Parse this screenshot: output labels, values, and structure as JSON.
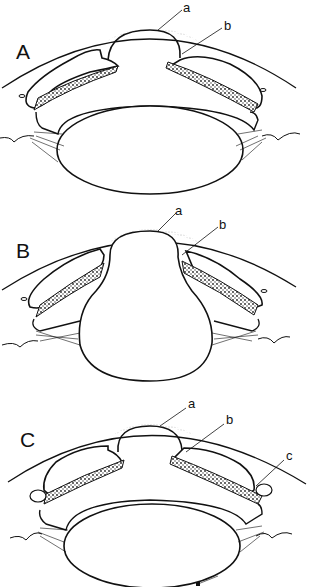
{
  "figure": {
    "panels": [
      {
        "id": "A",
        "label": "A",
        "callouts": [
          "a",
          "b"
        ]
      },
      {
        "id": "B",
        "label": "B",
        "callouts": [
          "a",
          "b"
        ]
      },
      {
        "id": "C",
        "label": "C",
        "callouts": [
          "a",
          "b",
          "c"
        ]
      }
    ],
    "colors": {
      "line": "#111111",
      "background": "#ffffff",
      "stipple": "#555555"
    }
  }
}
